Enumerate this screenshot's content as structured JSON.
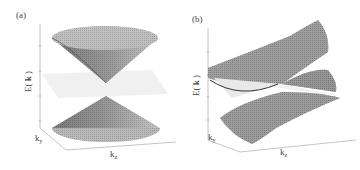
{
  "figure": {
    "panels": [
      {
        "tag": "(a)",
        "ylabel_prefix": "E( ",
        "ylabel_bold": "k",
        "ylabel_suffix": " )",
        "axis_ky": "k",
        "axis_ky_sub": "y",
        "axis_kz": "k",
        "axis_kz_sub": "z",
        "description": "Upright Dirac cone: upper and lower cones touching at a point, with a translucent Fermi-level plane between them"
      },
      {
        "tag": "(b)",
        "ylabel_prefix": "E( ",
        "ylabel_bold": "k",
        "ylabel_suffix": " )",
        "axis_ky": "k",
        "axis_ky_sub": "y",
        "axis_kz": "k",
        "axis_kz_sub": "z",
        "description": "Strongly tilted (type-II) cone: two saddle-like sheets crossing at a point, intersecting the Fermi-level plane"
      }
    ],
    "colors": {
      "surface_dark": "#5a5a5a",
      "surface_mid": "#9a9a9a",
      "surface_light": "#d0d0d0",
      "plane": "#ececec",
      "axis": "#b5b5b5"
    }
  }
}
